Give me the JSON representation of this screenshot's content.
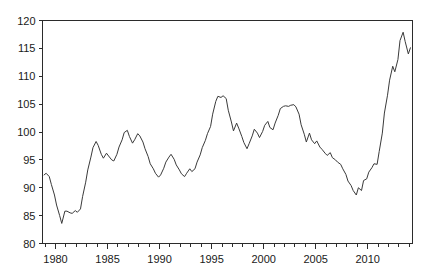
{
  "chart_data": {
    "type": "line",
    "title": "",
    "subtitle": "",
    "xlabel": "",
    "ylabel": "",
    "xlim": [
      1978.75,
      2014.3
    ],
    "ylim": [
      80,
      120
    ],
    "grid": false,
    "legend": null,
    "series_name": "index",
    "line_color": "#3a3a3a",
    "axis_color": "#2b2b2b",
    "background_color": "#ffffff",
    "y_ticks": [
      80,
      85,
      90,
      95,
      100,
      105,
      110,
      115,
      120
    ],
    "y_tick_labels": [
      "80",
      "85",
      "90",
      "95",
      "100",
      "105",
      "110",
      "115",
      "120"
    ],
    "x_ticks_major": [
      1980,
      1985,
      1990,
      1995,
      2000,
      2005,
      2010
    ],
    "x_tick_labels": [
      "1980",
      "1985",
      "1990",
      "1995",
      "2000",
      "2005",
      "2010"
    ],
    "x_minor_tick_step": 1,
    "x_minor_ticks": [
      1979,
      1980,
      1981,
      1982,
      1983,
      1984,
      1985,
      1986,
      1987,
      1988,
      1989,
      1990,
      1991,
      1992,
      1993,
      1994,
      1995,
      1996,
      1997,
      1998,
      1999,
      2000,
      2001,
      2002,
      2003,
      2004,
      2005,
      2006,
      2007,
      2008,
      2009,
      2010,
      2011,
      2012,
      2013,
      2014
    ],
    "x": [
      1978.9,
      1979.1,
      1979.4,
      1979.6,
      1979.9,
      1980.1,
      1980.4,
      1980.6,
      1980.9,
      1981.1,
      1981.4,
      1981.6,
      1981.9,
      1982.1,
      1982.4,
      1982.6,
      1982.9,
      1983.1,
      1983.4,
      1983.6,
      1983.9,
      1984.1,
      1984.4,
      1984.6,
      1984.9,
      1985.1,
      1985.4,
      1985.6,
      1985.9,
      1986.1,
      1986.4,
      1986.6,
      1986.9,
      1987.1,
      1987.4,
      1987.6,
      1987.9,
      1988.1,
      1988.4,
      1988.6,
      1988.9,
      1989.1,
      1989.4,
      1989.6,
      1989.9,
      1990.1,
      1990.4,
      1990.6,
      1990.9,
      1991.1,
      1991.4,
      1991.6,
      1991.9,
      1992.1,
      1992.4,
      1992.6,
      1992.9,
      1993.1,
      1993.4,
      1993.6,
      1993.9,
      1994.1,
      1994.4,
      1994.6,
      1994.9,
      1995.1,
      1995.4,
      1995.6,
      1995.9,
      1996.1,
      1996.4,
      1996.6,
      1996.9,
      1997.1,
      1997.4,
      1997.6,
      1997.9,
      1998.1,
      1998.4,
      1998.6,
      1998.9,
      1999.1,
      1999.4,
      1999.6,
      1999.9,
      2000.1,
      2000.4,
      2000.6,
      2000.9,
      2001.1,
      2001.4,
      2001.6,
      2001.9,
      2002.1,
      2002.4,
      2002.6,
      2002.9,
      2003.1,
      2003.4,
      2003.6,
      2003.9,
      2004.1,
      2004.4,
      2004.6,
      2004.9,
      2005.1,
      2005.4,
      2005.6,
      2005.9,
      2006.1,
      2006.4,
      2006.6,
      2006.9,
      2007.1,
      2007.4,
      2007.6,
      2007.9,
      2008.1,
      2008.4,
      2008.6,
      2008.9,
      2009.1,
      2009.4,
      2009.6,
      2009.9,
      2010.1,
      2010.4,
      2010.6,
      2010.9,
      2011.1,
      2011.4,
      2011.6,
      2011.9,
      2012.1,
      2012.4,
      2012.6,
      2012.9,
      2013.1,
      2013.4,
      2013.6,
      2013.9,
      2014.1
    ],
    "y": [
      92.3,
      92.6,
      92.0,
      90.6,
      88.7,
      86.9,
      85.0,
      83.6,
      85.8,
      85.8,
      85.5,
      85.4,
      85.9,
      85.6,
      86.2,
      88.4,
      91.0,
      93.2,
      95.5,
      97.2,
      98.3,
      97.6,
      96.0,
      95.3,
      96.2,
      95.7,
      95.0,
      94.8,
      96.0,
      97.3,
      98.6,
      99.9,
      100.3,
      99.2,
      98.0,
      98.6,
      99.7,
      99.3,
      98.2,
      97.0,
      95.6,
      94.3,
      93.4,
      92.6,
      91.9,
      92.3,
      93.5,
      94.6,
      95.5,
      96.0,
      95.1,
      94.1,
      93.2,
      92.5,
      92.0,
      92.6,
      93.4,
      92.9,
      93.4,
      94.6,
      95.9,
      97.2,
      98.5,
      99.7,
      101.0,
      103.2,
      105.5,
      106.4,
      106.2,
      106.5,
      106.0,
      103.9,
      101.8,
      100.2,
      101.6,
      100.7,
      99.2,
      98.1,
      97.0,
      97.9,
      99.3,
      100.5,
      99.8,
      99.0,
      100.1,
      101.2,
      101.9,
      100.8,
      100.4,
      101.6,
      103.0,
      104.2,
      104.6,
      104.7,
      104.6,
      104.8,
      104.9,
      104.5,
      103.2,
      101.3,
      99.6,
      98.2,
      99.8,
      98.6,
      97.9,
      98.4,
      97.3,
      96.9,
      96.2,
      95.8,
      96.3,
      95.4,
      95.0,
      94.6,
      94.2,
      93.4,
      92.4,
      91.2,
      90.4,
      89.5,
      88.7,
      90.0,
      89.5,
      91.3,
      91.6,
      92.8,
      93.6,
      94.3,
      94.2,
      96.5,
      99.8,
      103.4,
      106.6,
      109.3,
      111.8,
      110.8,
      113.0,
      116.4,
      117.9,
      116.2,
      114.0,
      115.1,
      113.9,
      112.8,
      111.2,
      110.4,
      110.7,
      111.2,
      111.4
    ]
  }
}
